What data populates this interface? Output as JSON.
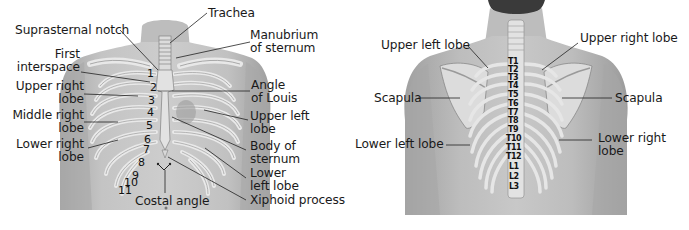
{
  "figure": {
    "colors": {
      "background": "#ffffff",
      "skin": "#b9b9b9",
      "skin_dark": "#9a9a9a",
      "bone": "#e6e6e6",
      "bone_outline": "#8a8a8a",
      "text": "#1a1a1a",
      "leader_line": "#2a2a2a"
    },
    "anterior_view": {
      "labels_left": [
        {
          "id": "suprasternal-notch",
          "text": "Suprasternal notch"
        },
        {
          "id": "first-interspace",
          "line1": "First",
          "line2": "interspace"
        },
        {
          "id": "upper-right-lobe",
          "line1": "Upper right",
          "line2": "lobe"
        },
        {
          "id": "middle-right-lobe",
          "line1": "Middle right",
          "line2": "lobe"
        },
        {
          "id": "lower-right-lobe",
          "line1": "Lower right",
          "line2": "lobe"
        }
      ],
      "labels_right": [
        {
          "id": "trachea",
          "text": "Trachea"
        },
        {
          "id": "manubrium",
          "line1": "Manubrium",
          "line2": "of sternum"
        },
        {
          "id": "angle-of-louis",
          "line1": "Angle",
          "line2": "of Louis"
        },
        {
          "id": "upper-left-lobe",
          "line1": "Upper left",
          "line2": "lobe"
        },
        {
          "id": "body-of-sternum",
          "line1": "Body of",
          "line2": "sternum"
        },
        {
          "id": "lower-left-lobe",
          "line1": "Lower",
          "line2": "left lobe"
        },
        {
          "id": "xiphoid-process",
          "text": "Xiphoid process"
        }
      ],
      "labels_bottom": [
        {
          "id": "costal-angle",
          "text": "Costal angle"
        }
      ],
      "rib_numbers": [
        "1",
        "2",
        "3",
        "4",
        "5",
        "6",
        "7",
        "8",
        "9",
        "10",
        "11"
      ]
    },
    "posterior_view": {
      "labels": [
        {
          "id": "upper-left-lobe",
          "text": "Upper left lobe"
        },
        {
          "id": "upper-right-lobe",
          "text": "Upper right lobe"
        },
        {
          "id": "scapula-left",
          "text": "Scapula"
        },
        {
          "id": "scapula-right",
          "text": "Scapula"
        },
        {
          "id": "lower-left-lobe",
          "text": "Lower left lobe"
        },
        {
          "id": "lower-right-lobe",
          "line1": "Lower right",
          "line2": "lobe"
        }
      ],
      "vertebrae": [
        "T1",
        "T2",
        "T3",
        "T4",
        "T5",
        "T6",
        "T7",
        "T8",
        "T9",
        "T10",
        "T11",
        "T12",
        "L1",
        "L2",
        "L3"
      ]
    }
  }
}
